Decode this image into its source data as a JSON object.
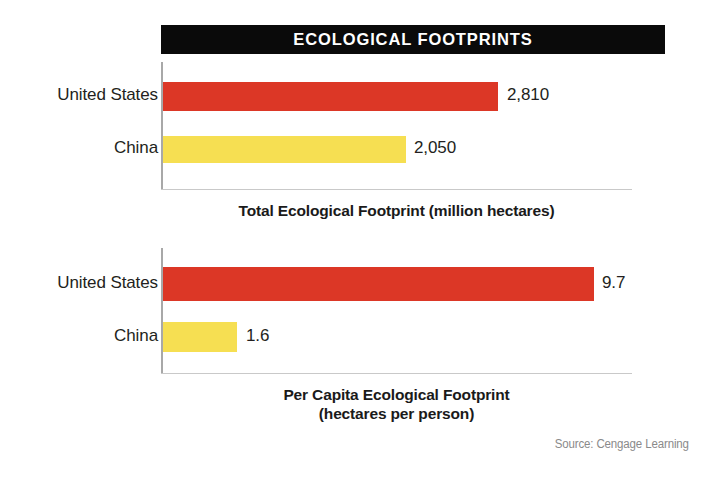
{
  "figure": {
    "title": "ECOLOGICAL FOOTPRINTS",
    "source": "Source: Cengage Learning",
    "title_bg": "#0a0a0a",
    "title_fg": "#ffffff"
  },
  "colors": {
    "united_states": "#dc3726",
    "china": "#f6df52",
    "axis": "#a8a8a8",
    "baseline": "#c9c9c9",
    "text": "#231f20",
    "source_text": "#8a8a8a"
  },
  "charts": [
    {
      "id": "total",
      "caption_line_1": "Total Ecological Footprint (million hectares)",
      "caption_line_2": "",
      "rows": [
        {
          "label": "United States",
          "value_label": "2,810"
        },
        {
          "label": "China",
          "value_label": "2,050"
        }
      ]
    },
    {
      "id": "per-capita",
      "caption_line_1": "Per Capita Ecological Footprint",
      "caption_line_2": "(hectares per person)",
      "rows": [
        {
          "label": "United States",
          "value_label": "9.7"
        },
        {
          "label": "China",
          "value_label": "1.6"
        }
      ]
    }
  ],
  "chart_data": [
    {
      "type": "bar",
      "orientation": "horizontal",
      "title": "Total Ecological Footprint (million hectares)",
      "categories": [
        "United States",
        "China"
      ],
      "values": [
        2810,
        2050
      ],
      "value_labels": [
        "2,810",
        "2,050"
      ],
      "colors": [
        "#dc3726",
        "#f6df52"
      ],
      "xlabel": "Total Ecological Footprint (million hectares)",
      "ylabel": "",
      "xlim": [
        0,
        3950
      ],
      "grid": false,
      "legend": "none"
    },
    {
      "type": "bar",
      "orientation": "horizontal",
      "title": "Per Capita Ecological Footprint (hectares per person)",
      "categories": [
        "United States",
        "China"
      ],
      "values": [
        9.7,
        1.6
      ],
      "value_labels": [
        "9.7",
        "1.6"
      ],
      "colors": [
        "#dc3726",
        "#f6df52"
      ],
      "xlabel": "Per Capita Ecological Footprint (hectares per person)",
      "ylabel": "",
      "xlim": [
        0,
        10.6
      ],
      "grid": false,
      "legend": "none"
    }
  ]
}
